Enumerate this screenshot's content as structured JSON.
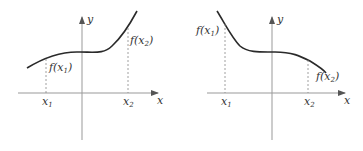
{
  "colors": {
    "axis": "#999999",
    "curve": "#2a2a2a",
    "guide": "#888888",
    "text": "#333333"
  },
  "panels": [
    {
      "id": "increasing",
      "axis_x_label": "x",
      "axis_y_label": "y",
      "tick_x1": {
        "base": "x",
        "sub": "1"
      },
      "tick_x2": {
        "base": "x",
        "sub": "2"
      },
      "point1_label": {
        "pre": "f(x",
        "sub": "1",
        "post": ")"
      },
      "point2_label": {
        "pre": "f(x",
        "sub": "2",
        "post": ")"
      }
    },
    {
      "id": "decreasing",
      "axis_x_label": "x",
      "axis_y_label": "y",
      "tick_x1": {
        "base": "x",
        "sub": "1"
      },
      "tick_x2": {
        "base": "x",
        "sub": "2"
      },
      "point1_label": {
        "pre": "f(x",
        "sub": "1",
        "post": ")"
      },
      "point2_label": {
        "pre": "f(x",
        "sub": "2",
        "post": ")"
      }
    }
  ]
}
